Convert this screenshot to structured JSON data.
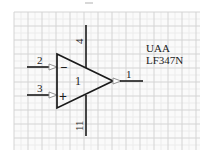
{
  "component": {
    "designator": "UAA",
    "part_number": "LF347N",
    "unit_label": "1",
    "type": "op-amp"
  },
  "pins": {
    "inverting": {
      "number": "2",
      "symbol": "−"
    },
    "non_inverting": {
      "number": "3",
      "symbol": "+"
    },
    "output": {
      "number": "1"
    },
    "v_positive": {
      "number": "4"
    },
    "v_negative": {
      "number": "11"
    }
  },
  "colors": {
    "grid_minor": "#ececec",
    "grid_major": "#d4d4d4",
    "stroke": "#1a1a1a",
    "arrow_fill": "#ffffff"
  }
}
